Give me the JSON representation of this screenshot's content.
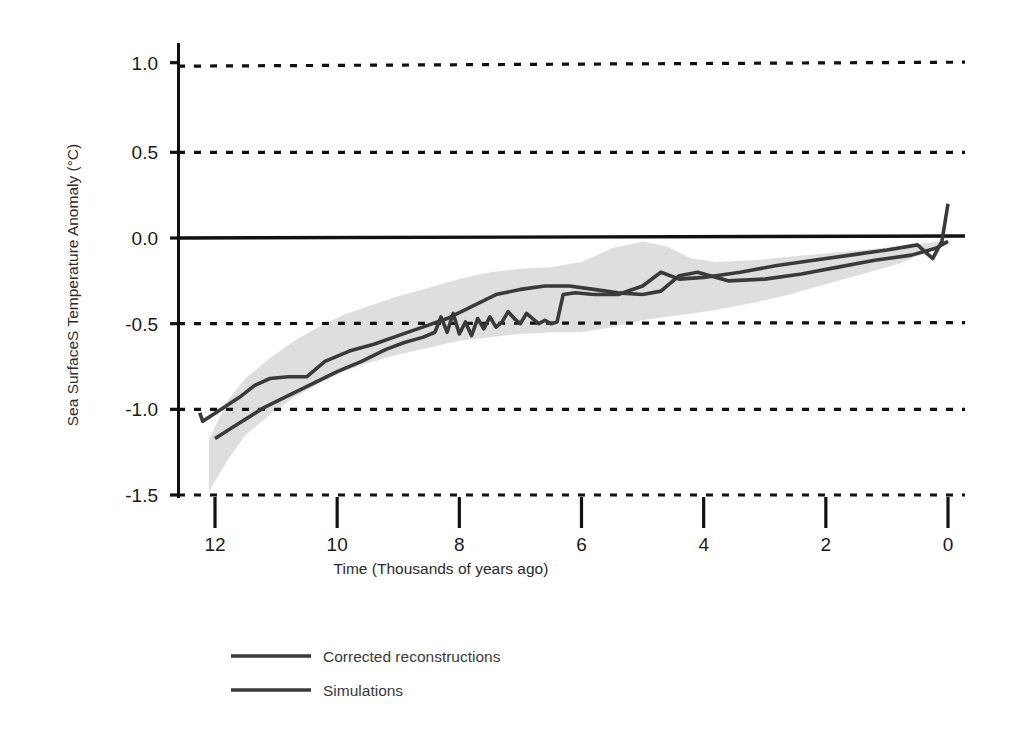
{
  "chart_data": {
    "type": "line",
    "title": "",
    "xlabel": "Time (Thousands of years ago)",
    "ylabel": "Sea SurfaceS Temperature Anomaly (°C)",
    "xlim": [
      12.4,
      -0.1
    ],
    "ylim": [
      -1.5,
      1.25
    ],
    "x_ticks": [
      12,
      10,
      8,
      6,
      4,
      2,
      0
    ],
    "y_ticks": [
      1.0,
      0.5,
      0.0,
      -0.5,
      -1.0,
      -1.5
    ],
    "x_tick_labels": [
      "12",
      "10",
      "8",
      "6",
      "4",
      "2",
      "0"
    ],
    "y_tick_labels": [
      "1.0",
      "0.5",
      "0.0",
      "-0.5",
      "-1.0",
      "-1.5"
    ],
    "x_axis_inverted": true,
    "grid": "horizontal-dashed",
    "zero_line": true,
    "legend_position": "below-left",
    "units": "°C",
    "series": [
      {
        "name": "Corrected reconstructions",
        "color": "#3a3a3a",
        "x": [
          12.25,
          12.2,
          11.9,
          11.6,
          11.35,
          11.1,
          10.8,
          10.5,
          10.2,
          9.8,
          9.4,
          9.0,
          8.6,
          8.2,
          7.8,
          7.4,
          7.0,
          6.6,
          6.2,
          5.8,
          5.4,
          5.0,
          4.7,
          4.4,
          4.1,
          3.6,
          3.0,
          2.4,
          1.8,
          1.2,
          0.6,
          0.2,
          0.0
        ],
        "y": [
          -1.02,
          -1.07,
          -1.0,
          -0.93,
          -0.86,
          -0.82,
          -0.81,
          -0.81,
          -0.72,
          -0.66,
          -0.62,
          -0.57,
          -0.52,
          -0.47,
          -0.4,
          -0.33,
          -0.3,
          -0.28,
          -0.28,
          -0.3,
          -0.32,
          -0.33,
          -0.31,
          -0.22,
          -0.2,
          -0.25,
          -0.24,
          -0.21,
          -0.17,
          -0.13,
          -0.1,
          -0.06,
          -0.02
        ]
      },
      {
        "name": "Simulations",
        "color": "#3a3a3a",
        "x": [
          12.0,
          11.6,
          11.2,
          10.8,
          10.4,
          10.0,
          9.6,
          9.2,
          8.9,
          8.6,
          8.4,
          8.3,
          8.2,
          8.1,
          8.0,
          7.9,
          7.8,
          7.7,
          7.6,
          7.5,
          7.4,
          7.3,
          7.2,
          7.1,
          7.0,
          6.9,
          6.8,
          6.7,
          6.6,
          6.5,
          6.4,
          6.3,
          6.1,
          5.8,
          5.4,
          5.0,
          4.7,
          4.4,
          4.0,
          3.4,
          2.8,
          2.2,
          1.6,
          1.0,
          0.5,
          0.25,
          0.1,
          0.0
        ],
        "y": [
          -1.17,
          -1.08,
          -0.99,
          -0.92,
          -0.85,
          -0.78,
          -0.72,
          -0.65,
          -0.61,
          -0.58,
          -0.55,
          -0.46,
          -0.55,
          -0.44,
          -0.56,
          -0.49,
          -0.57,
          -0.47,
          -0.53,
          -0.46,
          -0.52,
          -0.49,
          -0.43,
          -0.47,
          -0.5,
          -0.44,
          -0.47,
          -0.5,
          -0.48,
          -0.5,
          -0.49,
          -0.33,
          -0.32,
          -0.33,
          -0.33,
          -0.28,
          -0.2,
          -0.24,
          -0.23,
          -0.2,
          -0.16,
          -0.13,
          -0.1,
          -0.07,
          -0.04,
          -0.12,
          -0.02,
          0.2
        ]
      }
    ],
    "uncertainty_band": {
      "name": "Reconstruction uncertainty envelope",
      "color": "#dcdcdc",
      "x": [
        12.1,
        11.8,
        11.5,
        11.1,
        10.7,
        10.3,
        9.9,
        9.5,
        9.0,
        8.5,
        8.0,
        7.5,
        7.0,
        6.5,
        6.0,
        5.5,
        5.0,
        4.6,
        4.2,
        3.8,
        3.2,
        2.6,
        2.0,
        1.4,
        0.8,
        0.4,
        0.1
      ],
      "upper": [
        -1.18,
        -0.95,
        -0.82,
        -0.7,
        -0.6,
        -0.52,
        -0.45,
        -0.4,
        -0.34,
        -0.29,
        -0.24,
        -0.2,
        -0.18,
        -0.17,
        -0.14,
        -0.06,
        -0.02,
        -0.05,
        -0.12,
        -0.14,
        -0.13,
        -0.11,
        -0.09,
        -0.07,
        -0.05,
        -0.03,
        -0.02
      ],
      "lower": [
        -1.48,
        -1.3,
        -1.15,
        -1.03,
        -0.93,
        -0.85,
        -0.78,
        -0.73,
        -0.68,
        -0.64,
        -0.6,
        -0.58,
        -0.56,
        -0.55,
        -0.55,
        -0.52,
        -0.48,
        -0.46,
        -0.44,
        -0.42,
        -0.38,
        -0.33,
        -0.27,
        -0.21,
        -0.15,
        -0.09,
        -0.04
      ]
    }
  },
  "axes": {
    "y_title": "Sea SurfaceS Temperature Anomaly (°C)",
    "x_title": "Time (Thousands of years ago)",
    "y_labels": [
      "1.0",
      "0.5",
      "0.0",
      "-0.5",
      "-1.0",
      "-1.5"
    ],
    "x_labels": [
      "12",
      "10",
      "8",
      "6",
      "4",
      "2",
      "0"
    ]
  },
  "legend": {
    "items": [
      {
        "label": "Corrected reconstructions",
        "color": "#3a3a3a"
      },
      {
        "label": "Simulations",
        "color": "#3a3a3a"
      }
    ]
  },
  "colors": {
    "line": "#3a3a3a",
    "band": "#dcdcdc",
    "grid": "#111111",
    "axis": "#111111",
    "background": "#ffffff"
  }
}
